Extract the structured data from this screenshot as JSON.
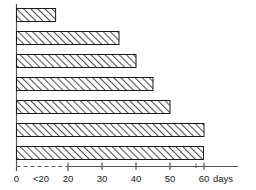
{
  "chart_data": {
    "type": "bar",
    "orientation": "horizontal",
    "title": "",
    "subtitle": "",
    "xlabel": "days",
    "ylabel": "",
    "categories": [
      "1",
      "2",
      "3",
      "4",
      "5",
      "6",
      "7"
    ],
    "values": [
      20,
      20,
      35,
      40,
      45,
      50,
      60
    ],
    "value_notes": [
      "<20",
      "<20",
      "35",
      "40",
      "45",
      "50",
      "60"
    ],
    "xlim": [
      0,
      63
    ],
    "axis_break": {
      "present": true,
      "from": 0,
      "to": 20,
      "style": "dashed"
    },
    "xticks": [
      0,
      20,
      30,
      40,
      50,
      60
    ],
    "xtick_labels": [
      "0",
      "20",
      "30",
      "40",
      "50",
      "60"
    ],
    "extra_tick_labels": [
      {
        "label": "<20",
        "value": 12
      }
    ],
    "unit_suffix": "days",
    "grid": false,
    "legend": null,
    "legend_position": "none",
    "series": [
      {
        "name": "duration",
        "values": [
          20,
          20,
          35,
          40,
          45,
          50,
          60
        ]
      }
    ],
    "bar_style": {
      "fill": "hatched-diagonal",
      "hatch_color": "#4a4a4a",
      "background": "#ffffff",
      "border_color": "#1a1a1a"
    }
  },
  "axis": {
    "line_color": "#555555",
    "tick_labels": {
      "zero": "0",
      "lt20": "<20",
      "t20": "20",
      "t30": "30",
      "t40": "40",
      "t50": "50",
      "t60": "60",
      "unit": "days"
    }
  },
  "colors": {
    "background": "#ffffff",
    "axis": "#555555",
    "bar_outline": "#1a1a1a",
    "hatch": "#555555",
    "text": "#1a1a1a"
  }
}
